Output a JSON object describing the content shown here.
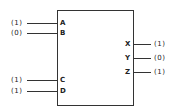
{
  "block": {
    "inputs": [
      {
        "pin": "A",
        "value": "(1)",
        "y": 23
      },
      {
        "pin": "B",
        "value": "(0)",
        "y": 33
      },
      {
        "pin": "C",
        "value": "(1)",
        "y": 80
      },
      {
        "pin": "D",
        "value": "(1)",
        "y": 91
      }
    ],
    "outputs": [
      {
        "pin": "X",
        "value": "(1)",
        "y": 44
      },
      {
        "pin": "Y",
        "value": "(0)",
        "y": 58
      },
      {
        "pin": "Z",
        "value": "(1)",
        "y": 72
      }
    ]
  }
}
